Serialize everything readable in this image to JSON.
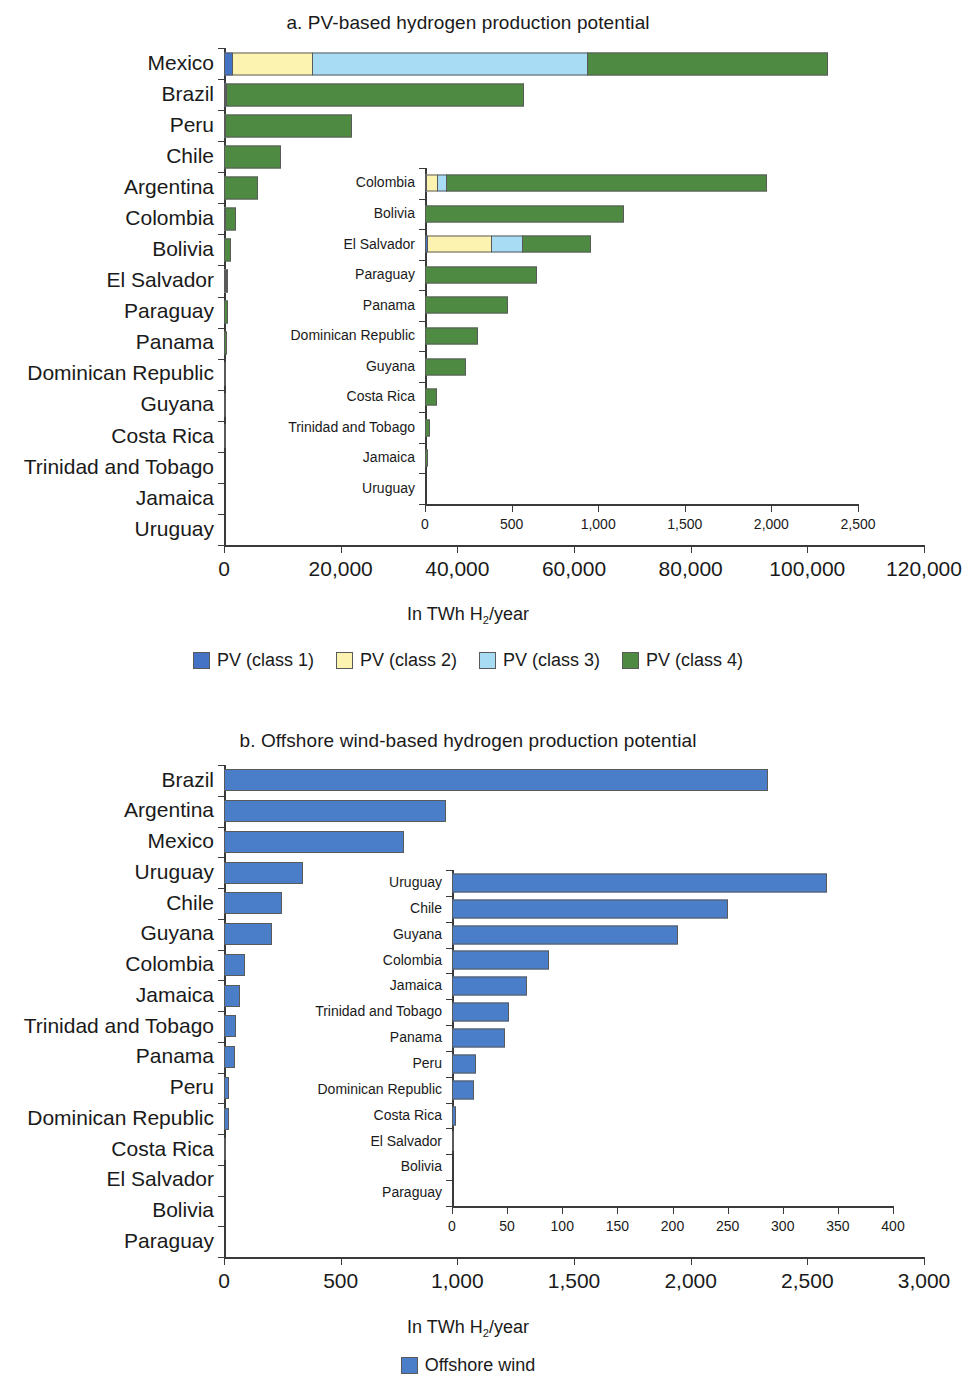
{
  "colors": {
    "pv_class1": "#4472c4",
    "pv_class2": "#fdf3b0",
    "pv_class3": "#a8dcf5",
    "pv_class4": "#4e8a42",
    "offshore_wind": "#4a7ec9",
    "axis": "#3a3a3a",
    "text": "#1a1a1a"
  },
  "panel_a": {
    "title": "a. PV-based hydrogen production potential",
    "axis_caption_pre": "In TWh H",
    "axis_caption_sub": "2",
    "axis_caption_post": "/year",
    "legend": [
      {
        "label": "PV (class 1)",
        "color": "#4472c4",
        "key": "pv_class1"
      },
      {
        "label": "PV (class 2)",
        "color": "#fdf3b0",
        "key": "pv_class2"
      },
      {
        "label": "PV (class 3)",
        "color": "#a8dcf5",
        "key": "pv_class3"
      },
      {
        "label": "PV (class 4)",
        "color": "#4e8a42",
        "key": "pv_class4"
      }
    ]
  },
  "panel_b": {
    "title": "b. Offshore wind-based hydrogen production potential",
    "axis_caption_pre": "In TWh H",
    "axis_caption_sub": "2",
    "axis_caption_post": "/year",
    "legend": [
      {
        "label": "Offshore wind",
        "color": "#4a7ec9",
        "key": "offshore_wind"
      }
    ]
  },
  "chart_data": [
    {
      "id": "panel-a-main",
      "type": "bar",
      "orientation": "horizontal",
      "stacked": true,
      "title": "a. PV-based hydrogen production potential",
      "xlabel": "In TWh H2/year",
      "ylabel": "",
      "xlim": [
        0,
        120000
      ],
      "xticks": [
        0,
        20000,
        40000,
        60000,
        80000,
        100000,
        120000
      ],
      "xticklabels": [
        "0",
        "20,000",
        "40,000",
        "60,000",
        "80,000",
        "100,000",
        "120,000"
      ],
      "grid": false,
      "legend_position": "bottom",
      "categories": [
        "Mexico",
        "Brazil",
        "Peru",
        "Chile",
        "Argentina",
        "Colombia",
        "Bolivia",
        "El Salvador",
        "Paraguay",
        "Panama",
        "Dominican Republic",
        "Guyana",
        "Costa Rica",
        "Trinidad and Tobago",
        "Jamaica",
        "Uruguay"
      ],
      "series": [
        {
          "name": "PV (class 1)",
          "color": "#4472c4",
          "values": [
            1500,
            120,
            60,
            0,
            0,
            10,
            0,
            20,
            0,
            0,
            0,
            0,
            0,
            0,
            0,
            0
          ]
        },
        {
          "name": "PV (class 2)",
          "color": "#fdf3b0",
          "values": [
            14000,
            0,
            0,
            0,
            0,
            70,
            0,
            370,
            0,
            0,
            0,
            0,
            0,
            0,
            0,
            0
          ]
        },
        {
          "name": "PV (class 3)",
          "color": "#a8dcf5",
          "values": [
            47200,
            180,
            240,
            0,
            0,
            55,
            0,
            190,
            0,
            0,
            0,
            0,
            0,
            0,
            0,
            0
          ]
        },
        {
          "name": "PV (class 4)",
          "color": "#4e8a42",
          "values": [
            41300,
            51000,
            21800,
            9800,
            5800,
            1855,
            1150,
            395,
            645,
            480,
            305,
            235,
            70,
            30,
            18,
            0
          ]
        }
      ],
      "totals": [
        104000,
        51300,
        22100,
        9800,
        5800,
        1990,
        1150,
        975,
        645,
        480,
        305,
        235,
        70,
        30,
        18,
        0
      ]
    },
    {
      "id": "panel-a-inset",
      "type": "bar",
      "orientation": "horizontal",
      "stacked": true,
      "title": "",
      "xlim": [
        0,
        2500
      ],
      "xticks": [
        0,
        500,
        1000,
        1500,
        2000,
        2500
      ],
      "xticklabels": [
        "0",
        "500",
        "1,000",
        "1,500",
        "2,000",
        "2,500"
      ],
      "grid": false,
      "categories": [
        "Colombia",
        "Bolivia",
        "El Salvador",
        "Paraguay",
        "Panama",
        "Dominican Republic",
        "Guyana",
        "Costa Rica",
        "Trinidad and Tobago",
        "Jamaica",
        "Uruguay"
      ],
      "series": [
        {
          "name": "PV (class 1)",
          "color": "#4472c4",
          "values": [
            10,
            0,
            20,
            0,
            0,
            0,
            0,
            0,
            0,
            0,
            0
          ]
        },
        {
          "name": "PV (class 2)",
          "color": "#fdf3b0",
          "values": [
            70,
            0,
            370,
            0,
            0,
            0,
            0,
            0,
            0,
            0,
            0
          ]
        },
        {
          "name": "PV (class 3)",
          "color": "#a8dcf5",
          "values": [
            55,
            0,
            190,
            0,
            0,
            0,
            0,
            0,
            0,
            0,
            0
          ]
        },
        {
          "name": "PV (class 4)",
          "color": "#4e8a42",
          "values": [
            1855,
            1150,
            395,
            645,
            480,
            305,
            235,
            70,
            30,
            18,
            0
          ]
        }
      ],
      "totals": [
        1990,
        1150,
        975,
        645,
        480,
        305,
        235,
        70,
        30,
        18,
        0
      ]
    },
    {
      "id": "panel-b-main",
      "type": "bar",
      "orientation": "horizontal",
      "stacked": false,
      "title": "b. Offshore wind-based hydrogen production potential",
      "xlabel": "In TWh H2/year",
      "ylabel": "",
      "xlim": [
        0,
        3000
      ],
      "xticks": [
        0,
        500,
        1000,
        1500,
        2000,
        2500,
        3000
      ],
      "xticklabels": [
        "0",
        "500",
        "1,000",
        "1,500",
        "2,000",
        "2,500",
        "3,000"
      ],
      "grid": false,
      "legend_position": "bottom",
      "categories": [
        "Brazil",
        "Argentina",
        "Mexico",
        "Uruguay",
        "Chile",
        "Guyana",
        "Colombia",
        "Jamaica",
        "Trinidad and Tobago",
        "Panama",
        "Peru",
        "Dominican Republic",
        "Costa Rica",
        "El Salvador",
        "Bolivia",
        "Paraguay"
      ],
      "series": [
        {
          "name": "Offshore wind",
          "color": "#4a7ec9",
          "values": [
            2330,
            950,
            770,
            340,
            250,
            205,
            88,
            68,
            52,
            48,
            22,
            20,
            4,
            1,
            0,
            0
          ]
        }
      ]
    },
    {
      "id": "panel-b-inset",
      "type": "bar",
      "orientation": "horizontal",
      "stacked": false,
      "title": "",
      "xlim": [
        0,
        400
      ],
      "xticks": [
        0,
        50,
        100,
        150,
        200,
        250,
        300,
        350,
        400
      ],
      "xticklabels": [
        "0",
        "50",
        "100",
        "150",
        "200",
        "250",
        "300",
        "350",
        "400"
      ],
      "grid": false,
      "categories": [
        "Uruguay",
        "Chile",
        "Guyana",
        "Colombia",
        "Jamaica",
        "Trinidad and Tobago",
        "Panama",
        "Peru",
        "Dominican Republic",
        "Costa Rica",
        "El Salvador",
        "Bolivia",
        "Paraguay"
      ],
      "series": [
        {
          "name": "Offshore wind",
          "color": "#4a7ec9",
          "values": [
            340,
            250,
            205,
            88,
            68,
            52,
            48,
            22,
            20,
            4,
            1,
            0,
            0
          ]
        }
      ]
    }
  ]
}
